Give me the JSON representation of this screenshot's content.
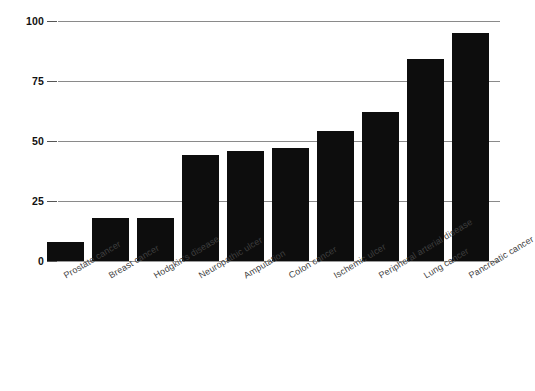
{
  "chart_data": {
    "type": "bar",
    "title": "",
    "subtitle": "",
    "xlabel": "",
    "ylabel": "",
    "ylim": [
      0,
      100
    ],
    "yticks": [
      "0",
      "25",
      "50",
      "75",
      "100"
    ],
    "grid": true,
    "legend": false,
    "orientation": "vertical",
    "bar_color": "#0d0d0d",
    "gridline_color": "#8a8a8a",
    "categories": [
      "Prostate cancer",
      "Breast cancer",
      "Hodgkin's disease",
      "Neuropathic ulcer",
      "Amputation",
      "Colon cancer",
      "Ischemic ulcer",
      "Peripheral arterial disease",
      "Lung cancer",
      "Pancreatic cancer"
    ],
    "values": [
      8,
      18,
      18,
      44,
      46,
      47,
      54,
      62,
      84,
      95
    ]
  }
}
